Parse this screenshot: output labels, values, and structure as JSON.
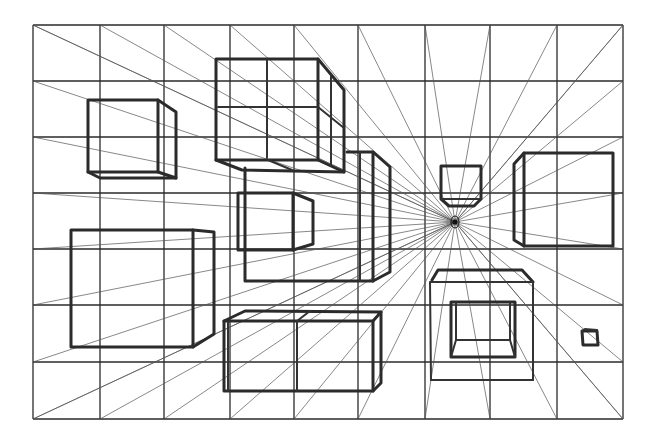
{
  "colors": {
    "background": "#ffffff",
    "ink": "#2b2b2b",
    "guide": "#555555"
  },
  "grid": {
    "columns_x": [
      33,
      100,
      164,
      230,
      294,
      358,
      425,
      490,
      557,
      623
    ],
    "rows_y": [
      25,
      81,
      137,
      193,
      249,
      305,
      362,
      419
    ]
  },
  "vanishing_point": {
    "x": 455,
    "y": 222,
    "label": "vanishing-point"
  },
  "boxes": [
    {
      "name": "box-top-left-small",
      "front": [
        88,
        100,
        158,
        172
      ],
      "back": [
        178,
        114,
        176,
        178
      ]
    },
    {
      "name": "box-top-center-stacked",
      "front": [
        216,
        59,
        318,
        160
      ],
      "back": [
        344,
        90,
        344,
        174
      ],
      "divisions": true
    },
    {
      "name": "box-center-left-small",
      "front": [
        238,
        193,
        294,
        250
      ],
      "back": [
        315,
        202,
        315,
        246
      ]
    },
    {
      "name": "box-center-tall-right",
      "front": [
        245,
        152,
        376,
        281
      ],
      "back": [
        392,
        168,
        392,
        274
      ]
    },
    {
      "name": "box-left-large",
      "front": [
        71,
        230,
        193,
        347
      ],
      "back": [
        215,
        231,
        215,
        333
      ]
    },
    {
      "name": "box-bottom-center-wide",
      "front": [
        224,
        320,
        373,
        391
      ],
      "back": [
        381,
        313,
        381,
        385
      ],
      "divisions": true
    },
    {
      "name": "box-center-right-small",
      "front": [
        441,
        166,
        481,
        207
      ],
      "back": [
        448,
        167,
        479,
        206
      ]
    },
    {
      "name": "box-right-medium",
      "front": [
        524,
        153,
        613,
        246
      ],
      "back": [
        513,
        165,
        513,
        239
      ]
    },
    {
      "name": "box-bottom-right-open",
      "front": [
        430,
        282,
        533,
        380
      ],
      "inner": [
        451,
        302,
        514,
        357
      ]
    },
    {
      "name": "box-tiny-right",
      "front": [
        582,
        330,
        598,
        346
      ]
    }
  ]
}
